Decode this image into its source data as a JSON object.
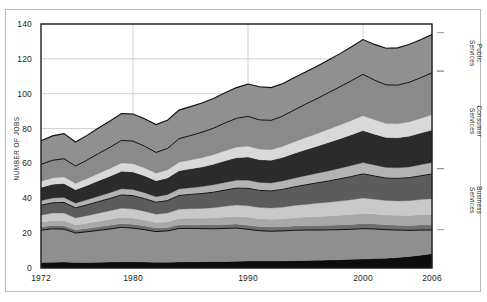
{
  "chart_data": {
    "type": "area",
    "title": "",
    "subtitle": "",
    "xlabel": "",
    "ylabel": "NUMBER OF JOBS",
    "xlim": [
      1972,
      2006
    ],
    "ylim": [
      0,
      140
    ],
    "ytick_labels": [
      "0",
      "20",
      "40",
      "60",
      "80",
      "100",
      "120",
      "140"
    ],
    "ytick_values": [
      0,
      20,
      40,
      60,
      80,
      100,
      120,
      140
    ],
    "xtick_labels": [
      "1972",
      "1980",
      "1990",
      "2000",
      "2006"
    ],
    "xtick_values": [
      1972,
      1980,
      1990,
      2000,
      2006
    ],
    "grid": "horizontal-and-vertical-light",
    "legend_position": "right-brackets",
    "stacked": true,
    "x": [
      1972,
      1973,
      1974,
      1975,
      1976,
      1977,
      1978,
      1979,
      1980,
      1981,
      1982,
      1983,
      1984,
      1985,
      1986,
      1987,
      1988,
      1989,
      1990,
      1991,
      1992,
      1993,
      1994,
      1995,
      1996,
      1997,
      1998,
      1999,
      2000,
      2001,
      2002,
      2003,
      2004,
      2005,
      2006
    ],
    "series": [
      {
        "name": "band-1",
        "color": "#0d0d0d",
        "values": [
          3.2,
          3.3,
          3.4,
          3.2,
          3.2,
          3.3,
          3.4,
          3.5,
          3.5,
          3.4,
          3.3,
          3.3,
          3.4,
          3.5,
          3.6,
          3.7,
          3.8,
          3.9,
          4.0,
          4.0,
          4.0,
          4.1,
          4.2,
          4.3,
          4.4,
          4.6,
          4.8,
          5.0,
          5.2,
          5.4,
          5.6,
          6.0,
          6.6,
          7.3,
          8.2
        ]
      },
      {
        "name": "band-2",
        "color": "#8f8f8f",
        "values": [
          18.5,
          19.2,
          18.9,
          16.9,
          17.6,
          18.3,
          19.0,
          19.8,
          19.4,
          18.6,
          17.6,
          18.0,
          19.3,
          19.2,
          19.0,
          18.8,
          18.9,
          19.0,
          18.2,
          17.4,
          17.1,
          17.2,
          17.4,
          17.5,
          17.4,
          17.3,
          17.2,
          17.2,
          17.4,
          17.0,
          16.4,
          15.8,
          15.0,
          14.5,
          13.6
        ]
      },
      {
        "name": "band-3",
        "color": "#6e6e6e",
        "values": [
          1.8,
          1.9,
          1.9,
          1.8,
          1.9,
          2.0,
          2.1,
          2.2,
          2.2,
          2.1,
          2.0,
          2.0,
          2.1,
          2.1,
          2.1,
          2.2,
          2.3,
          2.4,
          2.4,
          2.4,
          2.4,
          2.4,
          2.5,
          2.5,
          2.6,
          2.6,
          2.7,
          2.8,
          2.9,
          2.9,
          2.8,
          2.8,
          2.8,
          2.9,
          2.9
        ]
      },
      {
        "name": "band-4",
        "color": "#a8a8a8",
        "values": [
          2.8,
          2.9,
          3.0,
          2.8,
          3.0,
          3.2,
          3.4,
          3.6,
          3.6,
          3.4,
          3.2,
          3.3,
          3.6,
          3.7,
          3.8,
          4.0,
          4.2,
          4.4,
          4.5,
          4.4,
          4.4,
          4.5,
          4.7,
          4.9,
          5.1,
          5.3,
          5.5,
          5.7,
          5.9,
          5.7,
          5.6,
          5.6,
          5.7,
          5.9,
          6.1
        ]
      },
      {
        "name": "band-5",
        "color": "#c9c9c9",
        "values": [
          4.0,
          4.2,
          4.3,
          4.0,
          4.3,
          4.6,
          4.9,
          5.2,
          5.2,
          5.0,
          4.7,
          4.9,
          5.3,
          5.5,
          5.7,
          5.9,
          6.2,
          6.4,
          6.6,
          6.5,
          6.5,
          6.7,
          7.0,
          7.3,
          7.6,
          7.9,
          8.2,
          8.5,
          8.8,
          8.5,
          8.3,
          8.3,
          8.5,
          8.7,
          9.0
        ]
      },
      {
        "name": "band-6",
        "color": "#5c5c5c",
        "values": [
          5.7,
          5.9,
          6.1,
          5.8,
          6.2,
          6.7,
          7.1,
          7.6,
          7.6,
          7.3,
          6.9,
          7.2,
          7.9,
          8.2,
          8.5,
          8.9,
          9.3,
          9.7,
          10.0,
          9.8,
          9.8,
          10.2,
          10.7,
          11.2,
          11.7,
          12.2,
          12.8,
          13.3,
          13.8,
          13.3,
          12.9,
          12.9,
          13.2,
          13.6,
          14.1
        ]
      },
      {
        "name": "band-7",
        "color": "#b3b3b3",
        "values": [
          2.6,
          2.7,
          2.8,
          2.7,
          2.9,
          3.1,
          3.3,
          3.5,
          3.5,
          3.4,
          3.2,
          3.4,
          3.7,
          3.8,
          4.0,
          4.2,
          4.4,
          4.6,
          4.7,
          4.6,
          4.6,
          4.8,
          5.0,
          5.3,
          5.5,
          5.8,
          6.0,
          6.3,
          6.5,
          6.3,
          6.1,
          6.1,
          6.2,
          6.4,
          6.6
        ]
      },
      {
        "name": "band-8",
        "color": "#2b2b2b",
        "values": [
          7.6,
          7.9,
          8.1,
          7.7,
          8.3,
          8.9,
          9.5,
          10.1,
          10.1,
          9.7,
          9.2,
          9.6,
          10.5,
          10.9,
          11.3,
          11.8,
          12.4,
          12.9,
          13.3,
          13.0,
          13.0,
          13.5,
          14.2,
          14.9,
          15.6,
          16.3,
          17.0,
          17.7,
          18.4,
          17.7,
          17.2,
          17.2,
          17.6,
          18.1,
          18.7
        ]
      },
      {
        "name": "band-9",
        "color": "#d9d9d9",
        "values": [
          3.5,
          3.6,
          3.7,
          3.6,
          3.8,
          4.1,
          4.4,
          4.7,
          4.7,
          4.5,
          4.3,
          4.5,
          4.9,
          5.1,
          5.3,
          5.5,
          5.8,
          6.0,
          6.2,
          6.1,
          6.1,
          6.3,
          6.6,
          6.9,
          7.2,
          7.6,
          7.9,
          8.2,
          8.5,
          8.2,
          8.0,
          8.0,
          8.2,
          8.4,
          8.7
        ]
      },
      {
        "name": "band-10",
        "color": "#8a8a8a",
        "values": [
          9.8,
          10.2,
          10.5,
          10.0,
          10.7,
          11.5,
          12.2,
          13.0,
          13.0,
          12.5,
          11.9,
          12.4,
          13.5,
          14.0,
          14.6,
          15.2,
          15.9,
          16.6,
          17.1,
          16.8,
          16.8,
          17.4,
          18.3,
          19.2,
          20.1,
          21.0,
          21.9,
          22.8,
          23.7,
          22.8,
          22.2,
          22.2,
          22.7,
          23.3,
          24.1
        ]
      },
      {
        "name": "band-11",
        "color": "#909090",
        "values": [
          13.5,
          14.0,
          14.4,
          13.8,
          14.2,
          14.6,
          15.0,
          15.4,
          15.6,
          15.8,
          16.0,
          16.2,
          16.4,
          16.6,
          16.8,
          17.0,
          17.3,
          17.6,
          18.6,
          19.0,
          18.8,
          18.6,
          18.5,
          18.4,
          18.6,
          18.8,
          19.0,
          19.4,
          20.0,
          20.5,
          21.0,
          21.4,
          21.7,
          21.9,
          22.0
        ]
      }
    ],
    "totals": [
      73.0,
      75.7,
      77.1,
      71.3,
      76.1,
      80.3,
      84.3,
      88.6,
      88.4,
      85.7,
      82.3,
      84.8,
      90.6,
      92.6,
      94.7,
      96.9,
      99.5,
      102.4,
      105.6,
      104.4,
      104.5,
      107.7,
      112.1,
      116.4,
      120.8,
      125.4,
      130.0,
      134.9,
      140.1,
      136.3,
      132.1,
      131.3,
      132.2,
      133.0,
      134.0
    ],
    "brackets": [
      {
        "label_line1": "Public",
        "label_line2": "Services",
        "y_top": 135,
        "y_bottom": 113
      },
      {
        "label_line1": "Consumer",
        "label_line2": "Services",
        "y_top": 113,
        "y_bottom": 57
      },
      {
        "label_line1": "Business",
        "label_line2": "Services",
        "y_top": 57,
        "y_bottom": 22
      }
    ],
    "outline_lines": [
      {
        "name": "business-services-top"
      },
      {
        "name": "consumer-services-top"
      },
      {
        "name": "lower-boundary"
      }
    ],
    "colors": {
      "axis": "#231f20",
      "grid": "#bdbdbd",
      "frame": "#b9b9bd",
      "background": "#ffffff"
    }
  }
}
